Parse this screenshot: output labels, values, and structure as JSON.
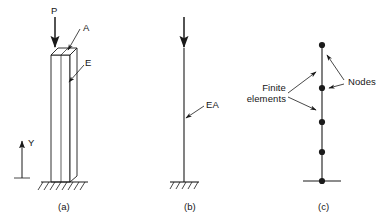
{
  "figure": {
    "type": "engineering-diagram",
    "background_color": "#ffffff",
    "line_color": "#1a1a1a",
    "panels": [
      {
        "id": "a",
        "caption": "(a)",
        "caption_x": 58,
        "caption_y": 201,
        "labels": [
          {
            "name": "load-label-p",
            "text": "P",
            "x": 51,
            "y": 5
          },
          {
            "name": "area-label-a",
            "text": "A",
            "x": 83,
            "y": 28
          },
          {
            "name": "modulus-label-e",
            "text": "E",
            "x": 85,
            "y": 63
          },
          {
            "name": "axis-label-y",
            "text": "Y",
            "x": 27,
            "y": 142
          }
        ]
      },
      {
        "id": "b",
        "caption": "(b)",
        "caption_x": 184,
        "caption_y": 201,
        "labels": [
          {
            "name": "stiffness-label-ea",
            "text": "EA",
            "x": 206,
            "y": 105
          }
        ]
      },
      {
        "id": "c",
        "caption": "(c)",
        "caption_x": 318,
        "caption_y": 201,
        "labels": [
          {
            "name": "finite-elements-label",
            "text": "Finite",
            "x": 251,
            "y": 85
          },
          {
            "name": "finite-elements-label-line2",
            "text": "elements",
            "x": 251,
            "y": 96
          },
          {
            "name": "nodes-label",
            "text": "Nodes",
            "x": 347,
            "y": 82
          }
        ],
        "nodes": [
          {
            "name": "node-1",
            "x": 322,
            "y": 45
          },
          {
            "name": "node-2",
            "x": 322,
            "y": 88
          },
          {
            "name": "node-3",
            "x": 322,
            "y": 122
          },
          {
            "name": "node-4",
            "x": 322,
            "y": 152
          },
          {
            "name": "node-5",
            "x": 322,
            "y": 181
          }
        ],
        "element_count": 4,
        "node_count": 5
      }
    ]
  }
}
